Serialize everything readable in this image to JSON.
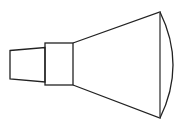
{
  "diagram": {
    "type": "line-drawing",
    "canvas": {
      "width": 186,
      "height": 125
    },
    "colors": {
      "background": "#ffffff",
      "stroke": "#222222",
      "face_line": "#888888"
    },
    "stroke_width": 1.3,
    "parts": [
      {
        "id": "neck",
        "shape": "trapezoid",
        "points": [
          [
            10,
            50.5
          ],
          [
            45,
            47.5
          ],
          [
            45,
            82
          ],
          [
            10,
            79
          ]
        ]
      },
      {
        "id": "collar",
        "shape": "rectangle",
        "x": 45,
        "y": 43,
        "width": 28,
        "height": 42
      },
      {
        "id": "cone",
        "shape": "trapezoid",
        "points": [
          [
            73,
            43
          ],
          [
            160,
            12
          ],
          [
            160,
            118
          ],
          [
            73,
            85
          ]
        ]
      },
      {
        "id": "face-arc",
        "shape": "arc",
        "start": [
          160,
          12
        ],
        "end": [
          160,
          118
        ],
        "bulge_x": 173
      }
    ]
  }
}
